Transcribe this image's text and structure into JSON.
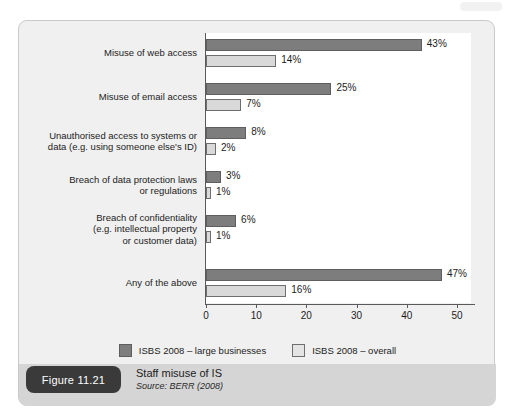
{
  "figure": {
    "badge_label": "Figure 11.21",
    "title": "Staff misuse of IS",
    "source": "Source: BERR (2008)"
  },
  "colors": {
    "large_businesses": "#7d7d7d",
    "overall": "#d9d9d9",
    "card_background": "#f0f0f0",
    "caption_background": "#d5d5d5",
    "badge_background": "#3a3a3a",
    "axis": "#5a5a5a"
  },
  "chart_data": {
    "type": "bar",
    "orientation": "horizontal",
    "title": "Staff misuse of IS",
    "xlabel": "",
    "ylabel": "",
    "xlim": [
      0,
      53
    ],
    "grid": false,
    "legend_position": "bottom",
    "xticks": [
      "0",
      "10",
      "20",
      "30",
      "40",
      "50"
    ],
    "xtick_values": [
      0,
      10,
      20,
      30,
      40,
      50
    ],
    "categories": [
      "Misuse of web access",
      "Misuse of email access",
      "Unauthorised access to systems or\ndata (e.g. using someone else's ID)",
      "Breach of data protection laws\nor regulations",
      "Breach of confidentiality\n(e.g. intellectual property\nor customer data)",
      "Any of the above"
    ],
    "series": [
      {
        "name": "ISBS 2008 – large businesses",
        "color": "#7d7d7d",
        "values": [
          43,
          25,
          8,
          3,
          6,
          47
        ],
        "labels": [
          "43%",
          "25%",
          "8%",
          "3%",
          "6%",
          "47%"
        ]
      },
      {
        "name": "ISBS 2008 – overall",
        "color": "#d9d9d9",
        "values": [
          14,
          7,
          2,
          1,
          1,
          16
        ],
        "labels": [
          "14%",
          "7%",
          "2%",
          "1%",
          "1%",
          "16%"
        ]
      }
    ]
  },
  "legend": [
    {
      "label": "ISBS 2008 – large businesses",
      "swatch": "large"
    },
    {
      "label": "ISBS 2008 – overall",
      "swatch": "overall"
    }
  ]
}
